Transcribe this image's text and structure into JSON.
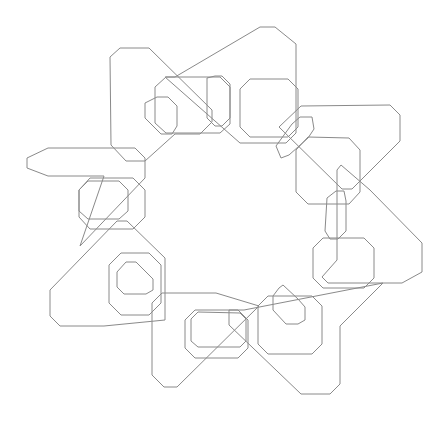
{
  "diagram": {
    "width": 447,
    "height": 431,
    "background": "#ffffff",
    "stroke_color": "#8a8a8a",
    "large_shapes": [
      {
        "name": "large-shape-top-left",
        "points": [
          [
            110,
            57
          ],
          [
            120,
            48
          ],
          [
            149,
            48
          ],
          [
            212,
            110
          ],
          [
            212,
            122
          ],
          [
            200,
            134
          ],
          [
            175,
            134
          ],
          [
            145,
            161
          ],
          [
            126,
            161
          ],
          [
            111,
            145
          ]
        ]
      },
      {
        "name": "large-shape-top",
        "points": [
          [
            260,
            27
          ],
          [
            275,
            27
          ],
          [
            296,
            44
          ],
          [
            296,
            133
          ],
          [
            286,
            143
          ],
          [
            240,
            143
          ],
          [
            165,
            77
          ],
          [
            175,
            77
          ]
        ]
      },
      {
        "name": "large-shape-top-right",
        "points": [
          [
            301,
            106
          ],
          [
            390,
            105
          ],
          [
            400,
            115
          ],
          [
            400,
            141
          ],
          [
            352,
            189
          ],
          [
            342,
            189
          ],
          [
            279,
            127
          ]
        ]
      },
      {
        "name": "large-shape-right",
        "points": [
          [
            341,
            165
          ],
          [
            370,
            190
          ],
          [
            422,
            243
          ],
          [
            422,
            272
          ],
          [
            402,
            283
          ],
          [
            328,
            283
          ],
          [
            322,
            277
          ],
          [
            337,
            260
          ],
          [
            337,
            170
          ]
        ]
      },
      {
        "name": "large-shape-bottom-right",
        "points": [
          [
            383,
            283
          ],
          [
            340,
            326
          ],
          [
            340,
            384
          ],
          [
            330,
            394
          ],
          [
            301,
            394
          ],
          [
            229,
            325
          ],
          [
            229,
            310
          ],
          [
            244,
            310
          ]
        ]
      },
      {
        "name": "large-shape-bottom",
        "points": [
          [
            259,
            306
          ],
          [
            177,
            387
          ],
          [
            164,
            387
          ],
          [
            152,
            375
          ],
          [
            152,
            303
          ],
          [
            162,
            293
          ],
          [
            216,
            293
          ]
        ]
      },
      {
        "name": "large-shape-bottom-left",
        "points": [
          [
            104,
            326
          ],
          [
            60,
            326
          ],
          [
            50,
            316
          ],
          [
            50,
            290
          ],
          [
            117,
            221
          ],
          [
            127,
            221
          ],
          [
            165,
            258
          ],
          [
            165,
            320
          ]
        ]
      },
      {
        "name": "large-shape-left",
        "points": [
          [
            104,
            176
          ],
          [
            48,
            176
          ],
          [
            27,
            168
          ],
          [
            27,
            158
          ],
          [
            48,
            148
          ],
          [
            135,
            148
          ],
          [
            145,
            158
          ],
          [
            145,
            178
          ],
          [
            80,
            246
          ]
        ]
      }
    ],
    "medium_shapes": [
      {
        "name": "medium-ring-top-left",
        "points": [
          [
            166,
            77
          ],
          [
            220,
            77
          ],
          [
            230,
            87
          ],
          [
            230,
            124
          ],
          [
            220,
            133
          ],
          [
            166,
            133
          ],
          [
            155,
            123
          ],
          [
            155,
            87
          ]
        ]
      },
      {
        "name": "medium-ring-top",
        "points": [
          [
            250,
            79
          ],
          [
            288,
            79
          ],
          [
            298,
            89
          ],
          [
            298,
            127
          ],
          [
            288,
            137
          ],
          [
            250,
            137
          ],
          [
            240,
            127
          ],
          [
            240,
            89
          ]
        ]
      },
      {
        "name": "medium-ring-right-upper",
        "points": [
          [
            308,
            137
          ],
          [
            349,
            138
          ],
          [
            360,
            150
          ],
          [
            360,
            192
          ],
          [
            349,
            204
          ],
          [
            308,
            204
          ],
          [
            296,
            192
          ],
          [
            296,
            150
          ]
        ]
      },
      {
        "name": "medium-ring-right",
        "points": [
          [
            323,
            238
          ],
          [
            364,
            238
          ],
          [
            374,
            248
          ],
          [
            374,
            278
          ],
          [
            364,
            288
          ],
          [
            323,
            288
          ],
          [
            313,
            278
          ],
          [
            313,
            248
          ]
        ]
      },
      {
        "name": "medium-ring-bottom-right",
        "points": [
          [
            268,
            296
          ],
          [
            312,
            296
          ],
          [
            322,
            306
          ],
          [
            322,
            344
          ],
          [
            312,
            354
          ],
          [
            268,
            354
          ],
          [
            258,
            344
          ],
          [
            258,
            306
          ]
        ]
      },
      {
        "name": "medium-ring-bottom",
        "points": [
          [
            195,
            310
          ],
          [
            238,
            310
          ],
          [
            248,
            320
          ],
          [
            248,
            348
          ],
          [
            238,
            358
          ],
          [
            195,
            358
          ],
          [
            185,
            348
          ],
          [
            185,
            320
          ]
        ]
      },
      {
        "name": "medium-ring-bottom-left",
        "points": [
          [
            121,
            253
          ],
          [
            149,
            253
          ],
          [
            161,
            265
          ],
          [
            161,
            303
          ],
          [
            149,
            315
          ],
          [
            121,
            315
          ],
          [
            109,
            303
          ],
          [
            109,
            265
          ]
        ]
      },
      {
        "name": "medium-ring-left",
        "points": [
          [
            90,
            178
          ],
          [
            133,
            178
          ],
          [
            145,
            190
          ],
          [
            145,
            217
          ],
          [
            133,
            229
          ],
          [
            90,
            229
          ],
          [
            79,
            217
          ],
          [
            79,
            190
          ]
        ]
      }
    ],
    "small_links": [
      {
        "name": "small-link-top-left",
        "points": [
          [
            145,
            103
          ],
          [
            157,
            97
          ],
          [
            168,
            97
          ],
          [
            177,
            106
          ],
          [
            177,
            126
          ],
          [
            172,
            134
          ],
          [
            161,
            134
          ],
          [
            145,
            118
          ]
        ]
      },
      {
        "name": "small-link-top",
        "points": [
          [
            207,
            78
          ],
          [
            215,
            76
          ],
          [
            222,
            76
          ],
          [
            230,
            84
          ],
          [
            230,
            118
          ],
          [
            222,
            126
          ],
          [
            215,
            126
          ],
          [
            207,
            118
          ]
        ]
      },
      {
        "name": "small-link-top-right",
        "points": [
          [
            292,
            124
          ],
          [
            300,
            117
          ],
          [
            312,
            117
          ],
          [
            314,
            129
          ],
          [
            308,
            138
          ],
          [
            289,
            155
          ],
          [
            281,
            158
          ],
          [
            276,
            146
          ]
        ]
      },
      {
        "name": "small-link-right",
        "points": [
          [
            327,
            198
          ],
          [
            336,
            191
          ],
          [
            344,
            191
          ],
          [
            346,
            201
          ],
          [
            346,
            231
          ],
          [
            338,
            239
          ],
          [
            330,
            239
          ],
          [
            325,
            231
          ]
        ]
      },
      {
        "name": "small-link-bottom-right",
        "points": [
          [
            279,
            288
          ],
          [
            283,
            285
          ],
          [
            298,
            299
          ],
          [
            305,
            307
          ],
          [
            305,
            320
          ],
          [
            298,
            324
          ],
          [
            286,
            324
          ],
          [
            273,
            310
          ],
          [
            273,
            296
          ]
        ]
      },
      {
        "name": "small-link-bottom",
        "points": [
          [
            198,
            312
          ],
          [
            240,
            313
          ],
          [
            246,
            319
          ],
          [
            246,
            341
          ],
          [
            240,
            347
          ],
          [
            198,
            347
          ],
          [
            191,
            341
          ],
          [
            191,
            319
          ]
        ]
      },
      {
        "name": "small-link-bottom-left",
        "points": [
          [
            126,
            262
          ],
          [
            136,
            262
          ],
          [
            153,
            279
          ],
          [
            153,
            290
          ],
          [
            146,
            294
          ],
          [
            124,
            294
          ],
          [
            117,
            287
          ],
          [
            117,
            272
          ]
        ]
      },
      {
        "name": "small-link-left",
        "points": [
          [
            88,
            181
          ],
          [
            119,
            181
          ],
          [
            128,
            190
          ],
          [
            128,
            211
          ],
          [
            119,
            219
          ],
          [
            88,
            219
          ],
          [
            79,
            211
          ],
          [
            79,
            190
          ]
        ]
      }
    ]
  }
}
